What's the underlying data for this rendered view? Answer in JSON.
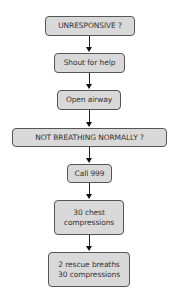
{
  "diagram": {
    "type": "flowchart",
    "direction": "top-to-bottom",
    "box_fill": "#d9d9d9",
    "box_border": "#555555",
    "nodes": [
      {
        "id": "unresponsive",
        "lines": [
          "UNRESPONSIVE ?"
        ]
      },
      {
        "id": "shout",
        "lines": [
          "Shout for help"
        ]
      },
      {
        "id": "airway",
        "lines": [
          "Open airway"
        ]
      },
      {
        "id": "not-breathing",
        "lines": [
          "NOT BREATHING NORMALLY ?"
        ]
      },
      {
        "id": "call",
        "lines": [
          "Call 999"
        ]
      },
      {
        "id": "chest",
        "lines": [
          "30 chest",
          "compressions"
        ]
      },
      {
        "id": "rescue",
        "lines": [
          "2 rescue breaths",
          "30 compressions"
        ]
      }
    ],
    "edges": [
      [
        "unresponsive",
        "shout"
      ],
      [
        "shout",
        "airway"
      ],
      [
        "airway",
        "not-breathing"
      ],
      [
        "not-breathing",
        "call"
      ],
      [
        "call",
        "chest"
      ],
      [
        "chest",
        "rescue"
      ]
    ]
  }
}
